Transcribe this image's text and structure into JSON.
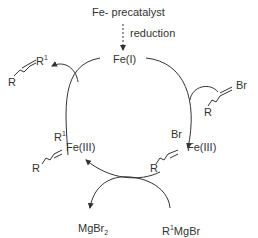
{
  "diagram": {
    "precatalyst": "Fe- precatalyst",
    "activation_step": "reduction",
    "catalyst": "Fe(I)",
    "intermediate_left": {
      "metal": "Fe(III)",
      "ligand_top": "R",
      "ligand_top_sup": "1",
      "vinyl_R": "R"
    },
    "intermediate_right": {
      "metal": "Fe(III)",
      "ligand_top": "Br",
      "vinyl_R": "R"
    },
    "substrate": {
      "halide": "Br",
      "R": "R"
    },
    "product": {
      "R1": "R",
      "R1_sup": "1",
      "R": "R"
    },
    "reagent": {
      "prefix": "R",
      "sup": "1",
      "rest": "MgBr"
    },
    "byproduct": {
      "main": "MgBr",
      "sub": "2"
    },
    "colors": {
      "lines": "#333333",
      "background": "#ffffff"
    }
  }
}
